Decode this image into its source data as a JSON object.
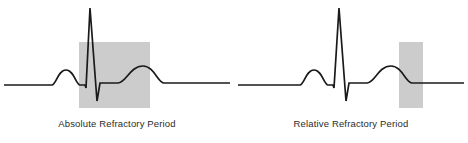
{
  "figure": {
    "background_color": "#ffffff",
    "width": 468,
    "height": 143
  },
  "style": {
    "trace_color": "#1a1a1a",
    "trace_width": 1.7,
    "shade_color": "#cccccc",
    "shade_stroke": "#b8b8b8",
    "caption_color": "#2b2b2b",
    "baseline_y": 85
  },
  "panels": [
    {
      "id": "absolute",
      "caption": "Absolute Refractory Period",
      "shaded_region": {
        "name": "absolute-refractory-shading",
        "x": 79,
        "y": 42,
        "width": 71,
        "height": 66,
        "fill": "#cccccc"
      },
      "waveform": {
        "baseline_y": 85,
        "p_wave": {
          "peak_x": 66,
          "peak_y": 70
        },
        "q_trough": {
          "x": 86,
          "y": 88
        },
        "r_peak": {
          "x": 90,
          "y": 8
        },
        "s_trough": {
          "x": 97,
          "y": 101
        },
        "t_wave": {
          "peak_x": 143,
          "peak_y": 66
        },
        "path": "M 4 85 L 52 85 C 56 85 58 70 66 70 C 74 70 76 85 80 85 L 85 85 L 86 88 L 90 8 L 97 101 L 100 83 L 113 83 L 118 83 C 126 83 130 66 143 66 C 154 66 158 83 164 83 L 230 83"
      }
    },
    {
      "id": "relative",
      "caption": "Relative Refractory Period",
      "shaded_region": {
        "name": "relative-refractory-shading",
        "x": 165,
        "y": 42,
        "width": 24,
        "height": 66,
        "fill": "#cccccc"
      },
      "waveform": {
        "baseline_y": 85,
        "p_wave": {
          "peak_x": 80,
          "peak_y": 70
        },
        "q_trough": {
          "x": 100,
          "y": 88
        },
        "r_peak": {
          "x": 105,
          "y": 8
        },
        "s_trough": {
          "x": 112,
          "y": 101
        },
        "t_wave": {
          "peak_x": 155,
          "peak_y": 66
        },
        "path": "M 4 85 L 66 85 C 70 85 72 70 80 70 C 88 70 90 85 94 85 L 99 85 L 100 88 L 105 8 L 112 101 L 115 83 L 128 83 L 133 83 C 141 83 144 66 157 66 C 168 66 172 83 178 83 L 230 83"
      }
    }
  ]
}
